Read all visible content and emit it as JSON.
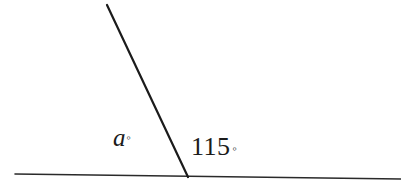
{
  "figure": {
    "background_color": "#ffffff",
    "stroke_color": "#1b1b1b"
  },
  "labels": {
    "unknown_angle": {
      "variable": "a",
      "degree_symbol": "◦",
      "full_text": "a°"
    },
    "known_angle": {
      "value": "115",
      "degree_symbol": "◦",
      "full_text": "115°"
    }
  },
  "geometry": {
    "vertex": {
      "x": 188,
      "y": 177
    },
    "base_line": {
      "name": "horizontal-base-line",
      "x1": 15,
      "y1": 174,
      "x2": 401,
      "y2": 179,
      "stroke_width": 1.6
    },
    "slant_ray": {
      "name": "slanted-ray",
      "x1": 107,
      "y1": 5,
      "x2": 188,
      "y2": 177,
      "stroke_width": 2.2
    }
  },
  "chart_data": {
    "type": "diagram",
    "subtype": "angle-diagram",
    "angles": [
      {
        "label": "a°",
        "position": "left-of-ray",
        "value": null,
        "known": false
      },
      {
        "label": "115°",
        "position": "right-of-ray",
        "value": 115,
        "known": true
      }
    ],
    "relationship": "a + 115 = 180",
    "units": "degrees"
  }
}
